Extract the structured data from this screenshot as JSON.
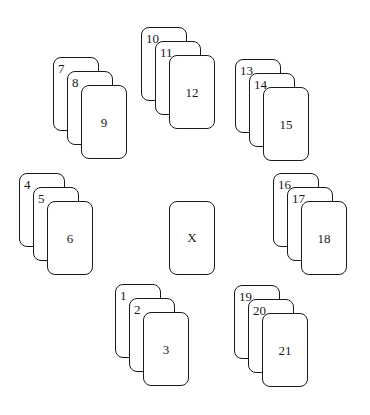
{
  "diagram": {
    "center_card": {
      "label": "X"
    },
    "stacks": [
      {
        "position": "top",
        "cards": [
          "10",
          "11",
          "12"
        ]
      },
      {
        "position": "top-left",
        "cards": [
          "7",
          "8",
          "9"
        ]
      },
      {
        "position": "top-right",
        "cards": [
          "13",
          "14",
          "15"
        ]
      },
      {
        "position": "left",
        "cards": [
          "4",
          "5",
          "6"
        ]
      },
      {
        "position": "right",
        "cards": [
          "16",
          "17",
          "18"
        ]
      },
      {
        "position": "bottom-left",
        "cards": [
          "1",
          "2",
          "3"
        ]
      },
      {
        "position": "bottom-right",
        "cards": [
          "19",
          "20",
          "21"
        ]
      }
    ]
  }
}
